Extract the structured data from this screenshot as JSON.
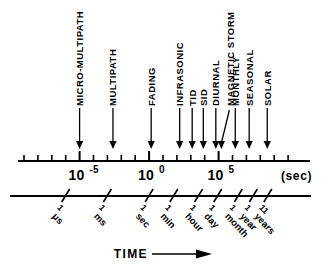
{
  "figure": {
    "caption_axis_unit": "(sec)",
    "bottom_axis_title": "TIME",
    "bottom_axis_arrow": "right-arrow"
  },
  "chart_data": {
    "type": "scatter",
    "title": "",
    "subtitle": "",
    "xlabel": "TIME",
    "ylabel": "",
    "xscale": "log10",
    "xlim": [
      -9,
      11
    ],
    "grid": false,
    "legend": false,
    "axis_unit_label": "(sec)",
    "major_tick_labels": [
      {
        "label": "10-5",
        "mantissa": "10",
        "exponent": "-5",
        "log10": -5
      },
      {
        "label": "100",
        "mantissa": "10",
        "exponent": "0",
        "log10": 0
      },
      {
        "label": "105",
        "mantissa": "10",
        "exponent": "5",
        "log10": 5
      }
    ],
    "minor_tick_log10": [
      -9,
      -8,
      -7,
      -6,
      -5,
      -4,
      -3,
      -2,
      -1,
      0,
      1,
      2,
      3,
      4,
      5,
      6,
      7,
      8,
      9,
      10
    ],
    "phenomena": [
      {
        "name": "MICRO-MULTIPATH",
        "log10": -5.0
      },
      {
        "name": "MULTIPATH",
        "log10": -2.6
      },
      {
        "name": "FADING",
        "log10": 0.15
      },
      {
        "name": "INFRASONIC",
        "log10": 2.2
      },
      {
        "name": "TID",
        "log10": 3.1
      },
      {
        "name": "SID",
        "log10": 3.9
      },
      {
        "name": "DIURNAL",
        "log10": 4.8
      },
      {
        "name": "MAGNETIC STORM",
        "log10": 5.2
      },
      {
        "name": "MONTHLY",
        "log10": 6.2
      },
      {
        "name": "SEASONAL",
        "log10": 7.2
      },
      {
        "name": "SOLAR",
        "log10": 8.5
      }
    ],
    "time_units": [
      {
        "label": "1 μs",
        "line1": "1",
        "line2": "μs",
        "log10": -6
      },
      {
        "label": "1 ms",
        "line1": "1",
        "line2": "ms",
        "log10": -3
      },
      {
        "label": "1 sec",
        "line1": "1",
        "line2": "sec",
        "log10": 0
      },
      {
        "label": "1 min",
        "line1": "1",
        "line2": "min",
        "log10": 1.78
      },
      {
        "label": "1 hour",
        "line1": "1",
        "line2": "hour",
        "log10": 3.56
      },
      {
        "label": "1 day",
        "line1": "1",
        "line2": "day",
        "log10": 4.94
      },
      {
        "label": "1 month",
        "line1": "1",
        "line2": "month",
        "log10": 6.42
      },
      {
        "label": "1 year",
        "line1": "1",
        "line2": "year",
        "log10": 7.5
      },
      {
        "label": "11 years",
        "line1": "11",
        "line2": "years",
        "log10": 8.54
      }
    ]
  }
}
